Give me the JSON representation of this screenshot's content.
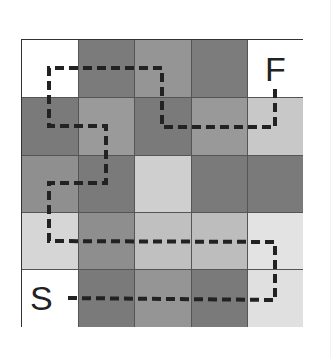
{
  "grid": {
    "rows": 5,
    "cols": 5,
    "cells": [
      [
        "#ffffff",
        "#7b7b7b",
        "#959595",
        "#7c7c7c",
        "#ffffff"
      ],
      [
        "#7a7a7a",
        "#9a9a9a",
        "#7a7a7a",
        "#999999",
        "#c8c8c8"
      ],
      [
        "#8f8f8f",
        "#7a7a7a",
        "#cfcfcf",
        "#7a7a7a",
        "#7a7a7a"
      ],
      [
        "#d6d6d6",
        "#8e8e8e",
        "#c0c0c0",
        "#bdbdbd",
        "#e3e3e3"
      ],
      [
        "#ffffff",
        "#7a7a7a",
        "#959595",
        "#7a7a7a",
        "#e0e0e0"
      ]
    ]
  },
  "labels": {
    "start": "S",
    "finish": "F"
  },
  "path": {
    "color": "#222222",
    "style": "dashed",
    "points": [
      [
        68,
        298
      ],
      [
        275,
        300
      ],
      [
        275,
        242
      ],
      [
        49,
        241
      ],
      [
        49,
        183
      ],
      [
        106,
        183
      ],
      [
        106,
        126
      ],
      [
        49,
        126
      ],
      [
        49,
        68
      ],
      [
        162,
        68
      ],
      [
        162,
        127
      ],
      [
        275,
        127
      ],
      [
        275,
        89
      ]
    ]
  }
}
